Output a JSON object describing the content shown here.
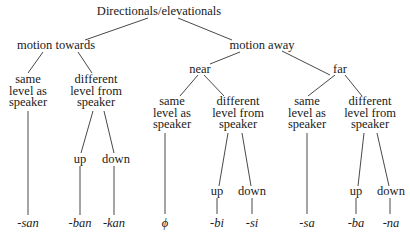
{
  "diagram": {
    "type": "tree",
    "root": "Directionals/elevationals",
    "nodes": [
      {
        "id": "root",
        "label": "Directionals/elevationals",
        "x": 159,
        "y": 6
      },
      {
        "id": "towards",
        "label": "motion towards",
        "x": 56,
        "y": 40
      },
      {
        "id": "away",
        "label": "motion away",
        "x": 262,
        "y": 40
      },
      {
        "id": "t_same",
        "label": "same\nlevel as\nspeaker",
        "x": 28,
        "y": 74
      },
      {
        "id": "t_diff",
        "label": "different\nlevel from\nspeaker",
        "x": 96,
        "y": 74
      },
      {
        "id": "near",
        "label": "near",
        "x": 200,
        "y": 64
      },
      {
        "id": "far",
        "label": "far",
        "x": 340,
        "y": 64
      },
      {
        "id": "n_same",
        "label": "same\nlevel as\nspeaker",
        "x": 172,
        "y": 96
      },
      {
        "id": "n_diff",
        "label": "different\nlevel from\nspeaker",
        "x": 238,
        "y": 96
      },
      {
        "id": "f_same",
        "label": "same\nlevel as\nspeaker",
        "x": 307,
        "y": 96
      },
      {
        "id": "f_diff",
        "label": "different\nlevel from\nspeaker",
        "x": 370,
        "y": 96
      },
      {
        "id": "t_up",
        "label": "up",
        "x": 80,
        "y": 154
      },
      {
        "id": "t_down",
        "label": "down",
        "x": 116,
        "y": 154
      },
      {
        "id": "n_up",
        "label": "up",
        "x": 217,
        "y": 186
      },
      {
        "id": "n_down",
        "label": "down",
        "x": 252,
        "y": 186
      },
      {
        "id": "f_up",
        "label": "up",
        "x": 356,
        "y": 186
      },
      {
        "id": "f_down",
        "label": "down",
        "x": 391,
        "y": 186
      }
    ],
    "leaves": [
      {
        "id": "l_san",
        "label": "-san",
        "x": 28,
        "y": 218
      },
      {
        "id": "l_ban",
        "label": "-ban",
        "x": 80,
        "y": 218
      },
      {
        "id": "l_kan",
        "label": "-kan",
        "x": 114,
        "y": 218
      },
      {
        "id": "l_zero",
        "label": "ϕ",
        "x": 165,
        "y": 218
      },
      {
        "id": "l_bi",
        "label": "-bi",
        "x": 217,
        "y": 218
      },
      {
        "id": "l_si",
        "label": "-si",
        "x": 252,
        "y": 218
      },
      {
        "id": "l_sa",
        "label": "-sa",
        "x": 307,
        "y": 218
      },
      {
        "id": "l_ba",
        "label": "-ba",
        "x": 356,
        "y": 218
      },
      {
        "id": "l_na",
        "label": "-na",
        "x": 391,
        "y": 218
      }
    ],
    "edges": [
      [
        148,
        18,
        85,
        40
      ],
      [
        178,
        18,
        232,
        40
      ],
      [
        43,
        52,
        28,
        73
      ],
      [
        78,
        52,
        92,
        73
      ],
      [
        240,
        52,
        210,
        64
      ],
      [
        282,
        51,
        330,
        75
      ],
      [
        198,
        75,
        180,
        96
      ],
      [
        204,
        75,
        224,
        96
      ],
      [
        335,
        75,
        308,
        96
      ],
      [
        345,
        75,
        362,
        96
      ],
      [
        28,
        111,
        28,
        215
      ],
      [
        93,
        111,
        81,
        153
      ],
      [
        104,
        111,
        114,
        153
      ],
      [
        165,
        133,
        165,
        214
      ],
      [
        228,
        133,
        219,
        186
      ],
      [
        242,
        133,
        251,
        186
      ],
      [
        307,
        133,
        307,
        214
      ],
      [
        364,
        133,
        358,
        186
      ],
      [
        377,
        133,
        389,
        186
      ],
      [
        80,
        166,
        80,
        215
      ],
      [
        114,
        166,
        114,
        215
      ],
      [
        217,
        198,
        217,
        214
      ],
      [
        252,
        198,
        252,
        214
      ],
      [
        356,
        198,
        356,
        214
      ],
      [
        390,
        198,
        390,
        214
      ]
    ]
  }
}
